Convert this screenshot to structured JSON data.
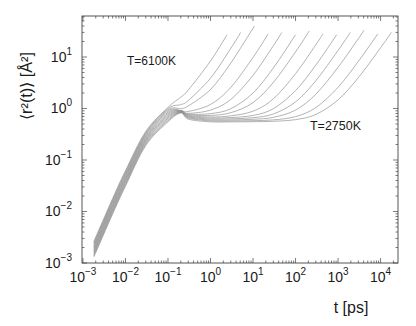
{
  "chart_data": {
    "type": "line",
    "title": "",
    "xlabel": "t [ps]",
    "ylabel": "⟨r²(t)⟩ [Å²]",
    "xscale": "log",
    "yscale": "log",
    "xlim": [
      0.00095,
      25700
    ],
    "ylim": [
      0.001,
      62.5
    ],
    "grid": false,
    "legend": null,
    "line_color": "#8a8a8a",
    "axis_color": "#444444",
    "xticks": [
      {
        "value": 0.001,
        "base": "10",
        "exp": "−3"
      },
      {
        "value": 0.01,
        "base": "10",
        "exp": "−2"
      },
      {
        "value": 0.1,
        "base": "10",
        "exp": "−1"
      },
      {
        "value": 1,
        "base": "10",
        "exp": "0"
      },
      {
        "value": 10,
        "base": "10",
        "exp": "1"
      },
      {
        "value": 100,
        "base": "10",
        "exp": "2"
      },
      {
        "value": 1000,
        "base": "10",
        "exp": "3"
      },
      {
        "value": 10000,
        "base": "10",
        "exp": "4"
      }
    ],
    "yticks": [
      {
        "value": 0.001,
        "base": "10",
        "exp": "−3"
      },
      {
        "value": 0.01,
        "base": "10",
        "exp": "−2"
      },
      {
        "value": 0.1,
        "base": "10",
        "exp": "−1"
      },
      {
        "value": 1,
        "base": "10",
        "exp": "0"
      },
      {
        "value": 10,
        "base": "10",
        "exp": "1"
      }
    ],
    "annotations": [
      {
        "text": "T=6100K",
        "x": 0.0108,
        "y": 7.0
      },
      {
        "text": "T=2750K",
        "x": 219,
        "y": 0.38
      }
    ],
    "series": [
      {
        "name": "T=6100K",
        "points": [
          [
            0.0018,
            0.0026
          ],
          [
            0.005,
            0.018
          ],
          [
            0.01,
            0.062
          ],
          [
            0.03,
            0.36
          ],
          [
            0.1,
            1.05
          ],
          [
            0.2,
            1.66
          ],
          [
            0.3,
            2.28
          ],
          [
            1,
            8.35
          ],
          [
            2.45,
            27
          ]
        ]
      },
      {
        "name": "series 2",
        "points": [
          [
            0.0018,
            0.00245
          ],
          [
            0.005,
            0.017
          ],
          [
            0.01,
            0.0585
          ],
          [
            0.03,
            0.341
          ],
          [
            0.1,
            0.995
          ],
          [
            0.2,
            1.19
          ],
          [
            0.3,
            1.43
          ],
          [
            1,
            3.88
          ],
          [
            3,
            14.7
          ],
          [
            5.15,
            30
          ]
        ]
      },
      {
        "name": "series 3",
        "points": [
          [
            0.0018,
            0.00232
          ],
          [
            0.005,
            0.016
          ],
          [
            0.01,
            0.0552
          ],
          [
            0.03,
            0.324
          ],
          [
            0.1,
            0.943
          ],
          [
            0.2,
            0.997
          ],
          [
            0.3,
            1.12
          ],
          [
            1,
            2.34
          ],
          [
            3,
            7.63
          ],
          [
            10.8,
            40
          ]
        ]
      },
      {
        "name": "series 4",
        "points": [
          [
            0.0018,
            0.00219
          ],
          [
            0.005,
            0.0151
          ],
          [
            0.01,
            0.0521
          ],
          [
            0.03,
            0.307
          ],
          [
            0.1,
            0.894
          ],
          [
            0.2,
            0.917
          ],
          [
            0.3,
            0.875
          ],
          [
            1,
            1.2
          ],
          [
            3,
            2.57
          ],
          [
            10,
            9.79
          ],
          [
            22.7,
            28
          ]
        ]
      },
      {
        "name": "series 5",
        "points": [
          [
            0.0018,
            0.00206
          ],
          [
            0.005,
            0.0143
          ],
          [
            0.01,
            0.0492
          ],
          [
            0.03,
            0.291
          ],
          [
            0.1,
            0.846
          ],
          [
            0.2,
            0.907
          ],
          [
            0.3,
            0.806
          ],
          [
            1,
            0.932
          ],
          [
            3,
            1.5
          ],
          [
            10,
            4.41
          ],
          [
            30,
            16.5
          ],
          [
            47.7,
            30
          ]
        ]
      },
      {
        "name": "series 6",
        "points": [
          [
            0.0018,
            0.00195
          ],
          [
            0.005,
            0.0135
          ],
          [
            0.01,
            0.0464
          ],
          [
            0.03,
            0.276
          ],
          [
            0.1,
            0.802
          ],
          [
            0.2,
            0.896
          ],
          [
            0.3,
            0.78
          ],
          [
            1,
            0.794
          ],
          [
            3,
            0.992
          ],
          [
            10,
            2.0
          ],
          [
            30,
            6.11
          ],
          [
            100,
            27
          ]
        ]
      },
      {
        "name": "series 7",
        "points": [
          [
            0.0018,
            0.00184
          ],
          [
            0.005,
            0.0127
          ],
          [
            0.01,
            0.0438
          ],
          [
            0.03,
            0.262
          ],
          [
            0.1,
            0.76
          ],
          [
            0.2,
            0.885
          ],
          [
            0.3,
            0.758
          ],
          [
            1,
            0.734
          ],
          [
            3,
            0.829
          ],
          [
            10,
            1.3
          ],
          [
            30,
            3.2
          ],
          [
            100,
            12.6
          ],
          [
            210,
            32
          ]
        ]
      },
      {
        "name": "series 8",
        "points": [
          [
            0.0018,
            0.00173
          ],
          [
            0.005,
            0.012
          ],
          [
            0.01,
            0.0414
          ],
          [
            0.03,
            0.249
          ],
          [
            0.1,
            0.72
          ],
          [
            0.2,
            0.874
          ],
          [
            0.3,
            0.735
          ],
          [
            1,
            0.686
          ],
          [
            3,
            0.72
          ],
          [
            10,
            0.887
          ],
          [
            30,
            1.54
          ],
          [
            100,
            4.75
          ],
          [
            300,
            17.3
          ],
          [
            441,
            28
          ]
        ]
      },
      {
        "name": "series 9",
        "points": [
          [
            0.0018,
            0.00164
          ],
          [
            0.005,
            0.0113
          ],
          [
            0.01,
            0.0391
          ],
          [
            0.03,
            0.236
          ],
          [
            0.1,
            0.683
          ],
          [
            0.2,
            0.863
          ],
          [
            0.3,
            0.713
          ],
          [
            1,
            0.653
          ],
          [
            3,
            0.666
          ],
          [
            10,
            0.733
          ],
          [
            30,
            0.989
          ],
          [
            100,
            2.22
          ],
          [
            300,
            6.96
          ],
          [
            927,
            27
          ]
        ]
      },
      {
        "name": "series 10",
        "points": [
          [
            0.0018,
            0.00155
          ],
          [
            0.005,
            0.0107
          ],
          [
            0.01,
            0.0369
          ],
          [
            0.03,
            0.224
          ],
          [
            0.1,
            0.647
          ],
          [
            0.2,
            0.853
          ],
          [
            0.3,
            0.691
          ],
          [
            1,
            0.624
          ],
          [
            3,
            0.631
          ],
          [
            10,
            0.662
          ],
          [
            30,
            0.782
          ],
          [
            100,
            1.34
          ],
          [
            300,
            3.46
          ],
          [
            1000,
            13.4
          ],
          [
            1946,
            30
          ]
        ]
      },
      {
        "name": "series 11",
        "points": [
          [
            0.0018,
            0.00146
          ],
          [
            0.005,
            0.0101
          ],
          [
            0.01,
            0.0348
          ],
          [
            0.03,
            0.212
          ],
          [
            0.1,
            0.613
          ],
          [
            0.2,
            0.842
          ],
          [
            0.3,
            0.671
          ],
          [
            1,
            0.597
          ],
          [
            3,
            0.599
          ],
          [
            10,
            0.617
          ],
          [
            30,
            0.673
          ],
          [
            100,
            0.931
          ],
          [
            300,
            1.89
          ],
          [
            1000,
            6.31
          ],
          [
            3000,
            22.7
          ],
          [
            4087,
            33
          ]
        ]
      },
      {
        "name": "series 12",
        "points": [
          [
            0.0018,
            0.00138
          ],
          [
            0.005,
            0.0095
          ],
          [
            0.01,
            0.0329
          ],
          [
            0.03,
            0.201
          ],
          [
            0.1,
            0.581
          ],
          [
            0.2,
            0.831
          ],
          [
            0.3,
            0.65
          ],
          [
            1,
            0.573
          ],
          [
            3,
            0.573
          ],
          [
            10,
            0.58
          ],
          [
            30,
            0.601
          ],
          [
            100,
            0.695
          ],
          [
            300,
            1.04
          ],
          [
            1000,
            2.58
          ],
          [
            3000,
            8.21
          ],
          [
            8580,
            28
          ]
        ]
      },
      {
        "name": "T=2750K",
        "points": [
          [
            0.0018,
            0.0013
          ],
          [
            0.005,
            0.009
          ],
          [
            0.01,
            0.031
          ],
          [
            0.03,
            0.191
          ],
          [
            0.1,
            0.55
          ],
          [
            0.2,
            0.82
          ],
          [
            0.3,
            0.62
          ],
          [
            1,
            0.55
          ],
          [
            3,
            0.55
          ],
          [
            10,
            0.554
          ],
          [
            30,
            0.564
          ],
          [
            100,
            0.608
          ],
          [
            300,
            0.766
          ],
          [
            1000,
            1.47
          ],
          [
            3000,
            3.97
          ],
          [
            10000,
            15.1
          ],
          [
            18020,
            30
          ]
        ]
      }
    ]
  }
}
